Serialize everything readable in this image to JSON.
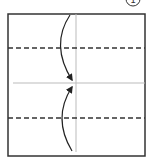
{
  "diagram": {
    "step_number": "1",
    "square": {
      "x": 8,
      "y": 14,
      "w": 137,
      "h": 142,
      "stroke": "#333333"
    },
    "crease_lines": [
      {
        "type": "solid-vertical",
        "x": 76,
        "color": "#bbbbbb"
      },
      {
        "type": "solid-horizontal",
        "y": 83,
        "color": "#bbbbbb"
      }
    ],
    "valley_folds": [
      {
        "type": "dashed",
        "y": 48
      },
      {
        "type": "dashed",
        "y": 118
      }
    ],
    "arrows": [
      {
        "direction": "down",
        "from": "top edge",
        "to": "center"
      },
      {
        "direction": "up",
        "from": "bottom edge",
        "to": "center"
      }
    ]
  }
}
